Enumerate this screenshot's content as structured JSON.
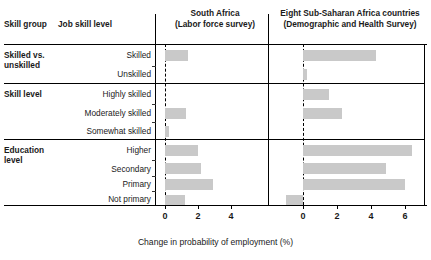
{
  "header": {
    "col_skill_group": "Skill group",
    "col_job_skill_level": "Job skill level",
    "panel_left_title_line1": "South Africa",
    "panel_left_title_line2": "(Labor force survey)",
    "panel_right_title_line1": "Eight Sub-Saharan Africa countries",
    "panel_right_title_line2": "(Demographic and Health Survey)"
  },
  "axis": {
    "title": "Change in probability of employment (%)",
    "left_ticks": [
      "0",
      "2",
      "4"
    ],
    "right_ticks": [
      "0",
      "2",
      "4",
      "6"
    ]
  },
  "groups": [
    {
      "name": "Skilled vs. unskilled",
      "line1": "Skilled vs.",
      "line2": "unskilled"
    },
    {
      "name": "Skill level",
      "line1": "Skill level",
      "line2": ""
    },
    {
      "name": "Education level",
      "line1": "Education",
      "line2": "level"
    }
  ],
  "rows": [
    {
      "label": "Skilled",
      "group": "Skilled vs. unskilled"
    },
    {
      "label": "Unskilled",
      "group": "Skilled vs. unskilled"
    },
    {
      "label": "Highly skilled",
      "group": "Skill level"
    },
    {
      "label": "Moderately skilled",
      "group": "Skill level"
    },
    {
      "label": "Somewhat skilled",
      "group": "Skill level"
    },
    {
      "label": "Higher",
      "group": "Education level"
    },
    {
      "label": "Secondary",
      "group": "Education level"
    },
    {
      "label": "Primary",
      "group": "Education level"
    },
    {
      "label": "Not primary",
      "group": "Education level"
    }
  ],
  "colors": {
    "bar_fill": "#c9c9c9",
    "rule": "#000000",
    "text": "#1a1a1a"
  },
  "chart_data": {
    "type": "bar",
    "orientation": "horizontal",
    "title": "",
    "xlabel": "Change in probability of employment (%)",
    "ylabel": "",
    "categories": [
      "Skilled",
      "Unskilled",
      "Highly skilled",
      "Moderately skilled",
      "Somewhat skilled",
      "Higher",
      "Secondary",
      "Primary",
      "Not primary"
    ],
    "panels": [
      {
        "name": "South Africa (Labor force survey)",
        "xlim": [
          0,
          5.6
        ],
        "xticks": [
          0,
          2,
          4
        ],
        "grid": false,
        "values": [
          1.4,
          0.0,
          0.0,
          1.3,
          0.25,
          2.0,
          2.2,
          2.9,
          1.2
        ]
      },
      {
        "name": "Eight Sub-Saharan Africa countries (Demographic and Health Survey)",
        "xlim": [
          -1.1,
          7.1
        ],
        "xticks": [
          0,
          2,
          4,
          6
        ],
        "grid": false,
        "values": [
          4.3,
          0.25,
          1.5,
          2.3,
          0.0,
          6.4,
          4.9,
          6.0,
          -1.0
        ]
      }
    ],
    "legend": null,
    "legend_position": "none"
  }
}
